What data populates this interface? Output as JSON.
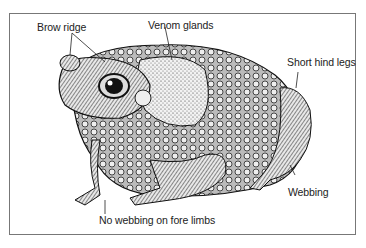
{
  "diagram": {
    "labels": {
      "brow_ridge": "Brow ridge",
      "venom_glands": "Venom glands",
      "short_hind_legs": "Short hind legs",
      "webbing": "Webbing",
      "no_webbing": "No webbing on fore limbs"
    }
  }
}
